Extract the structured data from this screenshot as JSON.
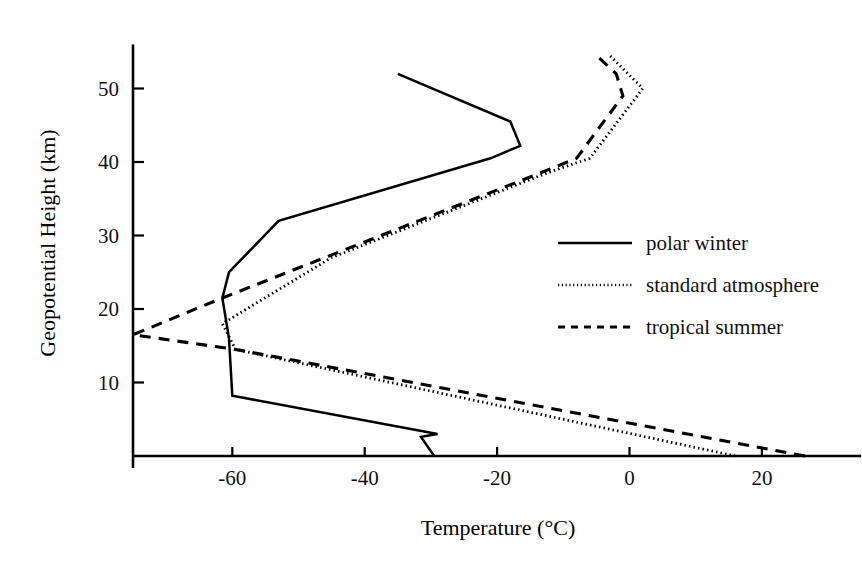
{
  "chart_data": {
    "type": "line",
    "title": "",
    "xlabel": "Temperature (°C)",
    "ylabel": "Geopotential Height (km)",
    "xlim": [
      -75,
      35
    ],
    "ylim": [
      0,
      56
    ],
    "xticks": [
      -60,
      -40,
      -20,
      0,
      20
    ],
    "xtick_labels": [
      "-60",
      "-40",
      "-20",
      "0",
      "20"
    ],
    "yticks": [
      10,
      20,
      30,
      40,
      50
    ],
    "ytick_labels": [
      "10",
      "20",
      "30",
      "40",
      "50"
    ],
    "grid": false,
    "legend_position": "right",
    "series": [
      {
        "name": "polar winter",
        "style": "solid",
        "color": "#000000",
        "points": [
          [
            -29.5,
            0.0
          ],
          [
            -31.5,
            2.6
          ],
          [
            -29.0,
            3.0
          ],
          [
            -60.0,
            8.2
          ],
          [
            -60.5,
            16.0
          ],
          [
            -61.5,
            21.5
          ],
          [
            -60.5,
            25.0
          ],
          [
            -53.0,
            32.0
          ],
          [
            -21.0,
            40.5
          ],
          [
            -16.5,
            42.2
          ],
          [
            -18.0,
            45.5
          ],
          [
            -35.0,
            52.0
          ]
        ]
      },
      {
        "name": "standard atmosphere",
        "style": "dotted",
        "color": "#000000",
        "points": [
          [
            16.0,
            0.0
          ],
          [
            -59.5,
            14.5
          ],
          [
            -61.5,
            18.0
          ],
          [
            -45.0,
            27.0
          ],
          [
            -12.5,
            38.5
          ],
          [
            -6.0,
            40.5
          ],
          [
            2.0,
            50.0
          ],
          [
            -3.0,
            54.5
          ]
        ]
      },
      {
        "name": "tropical summer",
        "style": "dashed",
        "color": "#000000",
        "points": [
          [
            26.5,
            0.0
          ],
          [
            -59.5,
            14.5
          ],
          [
            -75.0,
            16.5
          ],
          [
            -61.5,
            21.5
          ],
          [
            -46.0,
            27.0
          ],
          [
            -13.5,
            38.5
          ],
          [
            -8.0,
            40.5
          ],
          [
            -1.0,
            49.0
          ],
          [
            -2.0,
            52.0
          ],
          [
            -5.0,
            54.5
          ]
        ]
      }
    ]
  },
  "legend": {
    "items": [
      {
        "label": "polar winter",
        "style": "solid"
      },
      {
        "label": "standard atmosphere",
        "style": "dotted"
      },
      {
        "label": "tropical summer",
        "style": "dashed"
      }
    ]
  }
}
